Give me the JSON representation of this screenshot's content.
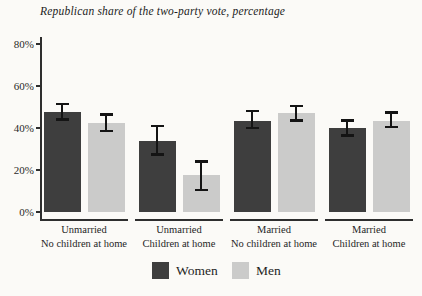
{
  "title": "Republican share of the two-party vote, percentage",
  "colors": {
    "women": "#3e3e3e",
    "men": "#cbcbca",
    "axis": "#2e2e2e",
    "error_bar": "#141414",
    "background": "#fbfaf7",
    "text": "#1f1f1f"
  },
  "legend": {
    "items": [
      {
        "label": "Women",
        "color": "#3e3e3e"
      },
      {
        "label": "Men",
        "color": "#cbcbca"
      }
    ]
  },
  "chart_data": {
    "type": "bar",
    "title": "Republican share of the two-party vote, percentage",
    "categories": [
      [
        "Unmarried",
        "No children at home"
      ],
      [
        "Unmarried",
        "Children at home"
      ],
      [
        "Married",
        "No children at home"
      ],
      [
        "Married",
        "Children at home"
      ]
    ],
    "series": [
      {
        "name": "Women",
        "values": [
          47.5,
          34,
          43.5,
          40
        ],
        "ci_low": [
          44,
          27.5,
          40,
          36.5
        ],
        "ci_high": [
          51.5,
          41,
          48,
          43.5
        ]
      },
      {
        "name": "Men",
        "values": [
          42.5,
          17.5,
          47,
          43.5
        ],
        "ci_low": [
          38.5,
          10.5,
          43.5,
          40.5
        ],
        "ci_high": [
          46.5,
          24,
          50.5,
          47.5
        ]
      }
    ],
    "xlabel": "",
    "ylabel": "",
    "ylim": [
      0,
      85
    ],
    "yticks": [
      0,
      20,
      40,
      60,
      80
    ],
    "ytick_labels": [
      "0%",
      "20%",
      "40%",
      "60%",
      "80%"
    ],
    "grid": false,
    "legend_position": "bottom",
    "error_bars": true
  }
}
